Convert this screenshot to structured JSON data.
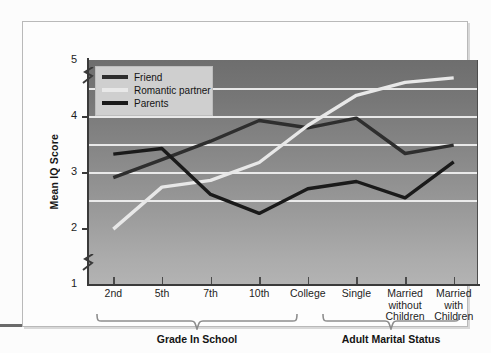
{
  "chart_data": {
    "type": "line",
    "title": "",
    "xlabel": "",
    "ylabel": "Mean IQ Score",
    "ylim": [
      1,
      5
    ],
    "yticks": [
      1,
      2,
      3,
      4,
      5
    ],
    "gridlines": [
      2.5,
      3,
      3.5,
      4,
      4.5
    ],
    "y_axis_break": true,
    "grid": true,
    "legend_position": "top-left",
    "categories": [
      "2nd",
      "5th",
      "7th",
      "10th",
      "College",
      "Single",
      "Married without Children",
      "Married with Children"
    ],
    "category_groups": [
      {
        "label": "Grade In School",
        "categories": [
          "2nd",
          "5th",
          "7th",
          "10th",
          "College"
        ]
      },
      {
        "label": "Adult Marital Status",
        "categories": [
          "Single",
          "Married without Children",
          "Married with Children"
        ]
      }
    ],
    "series": [
      {
        "name": "Friend",
        "color": "#2e2e2e",
        "values": [
          2.9,
          3.22,
          3.55,
          3.92,
          3.79,
          3.96,
          3.33,
          3.48
        ]
      },
      {
        "name": "Romantic partner",
        "color": "#e8e8e8",
        "values": [
          1.98,
          2.73,
          2.85,
          3.17,
          3.83,
          4.37,
          4.6,
          4.68
        ]
      },
      {
        "name": "Parents",
        "color": "#1a1a1a",
        "values": [
          3.32,
          3.42,
          2.6,
          2.26,
          2.7,
          2.83,
          2.54,
          3.18
        ]
      }
    ]
  },
  "axis": {
    "y_title": "Mean IQ Score",
    "y_tick_labels": [
      "5",
      "4",
      "3",
      "2",
      "1"
    ],
    "x_tick_labels": [
      "2nd",
      "5th",
      "7th",
      "10th",
      "College",
      "Single",
      "Married\nwithout\nChildren",
      "Married\nwith\nChildren"
    ]
  },
  "legend": {
    "items": [
      {
        "label": "Friend",
        "color": "#2e2e2e"
      },
      {
        "label": "Romantic partner",
        "color": "#e8e8e8"
      },
      {
        "label": "Parents",
        "color": "#1a1a1a"
      }
    ]
  },
  "groups": {
    "left_label": "Grade In School",
    "right_label": "Adult Marital Status"
  }
}
